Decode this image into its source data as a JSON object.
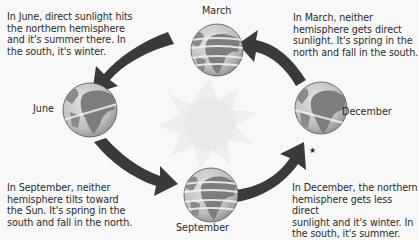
{
  "diagram": {
    "center": {
      "name": "Sun",
      "icon": "sun-icon"
    },
    "positions": [
      {
        "id": "march",
        "label": "March"
      },
      {
        "id": "june",
        "label": "June"
      },
      {
        "id": "september",
        "label": "September"
      },
      {
        "id": "december",
        "label": "December"
      }
    ],
    "captions": {
      "june": "In June, direct sunlight hits the northern hemisphere and it's summer there. In the south, it's winter.",
      "march": "In March, neither hemisphere gets direct sunlight. It's spring in the north and fall in the south.",
      "september": "In September, neither hemisphere tilts toward the Sun. It's spring in the south and fall in the north.",
      "december": "In December, the northern hemisphere gets less direct sunlight and it's winter. In the south, it's summer."
    },
    "caption_lines": {
      "june": [
        "In June, direct sunlight hits",
        "the northern hemisphere",
        "and it's summer there. In",
        "the south, it's winter."
      ],
      "march": [
        "In March, neither",
        "hemisphere gets direct",
        "sunlight. It's spring in the",
        "north and fall in the south."
      ],
      "september": [
        "In September, neither",
        "hemisphere tilts toward",
        "the Sun. It's spring in the",
        "south and fall in the north."
      ],
      "december": [
        "In December, the northern",
        "hemisphere gets less direct",
        "sunlight and it's winter. In",
        "the south, it's summer."
      ]
    },
    "marker": "★",
    "colors": {
      "background": "#f8f8f8",
      "arrow": "#3a3a3a",
      "ocean": "#c9c9c9",
      "land": "#7d7d7d",
      "sun": "#ececec",
      "text": "#2b2b2b"
    }
  }
}
